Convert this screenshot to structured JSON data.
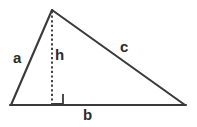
{
  "diagram": {
    "type": "geometry-triangle",
    "background_color": "#ffffff",
    "stroke_color": "#3a3a3a",
    "text_color": "#2b2b2b",
    "vertices": {
      "apex": {
        "x": 52,
        "y": 10
      },
      "bottom_left": {
        "x": 11,
        "y": 105
      },
      "bottom_right": {
        "x": 185,
        "y": 105
      },
      "foot_of_altitude": {
        "x": 52,
        "y": 105
      }
    },
    "edges": {
      "left_side": {
        "label": "a",
        "from": "bottom_left",
        "to": "apex",
        "style": "solid"
      },
      "base": {
        "label": "b",
        "from": "bottom_left",
        "to": "bottom_right",
        "style": "solid"
      },
      "hypotenuse_side": {
        "label": "c",
        "from": "apex",
        "to": "bottom_right",
        "style": "solid"
      },
      "altitude": {
        "label": "h",
        "from": "apex",
        "to": "foot_of_altitude",
        "style": "dashed"
      }
    },
    "labels": {
      "a": "a",
      "b": "b",
      "c": "c",
      "h": "h"
    },
    "right_angle_marker": {
      "x": 52,
      "y": 94,
      "size": 11,
      "visible": true
    }
  }
}
